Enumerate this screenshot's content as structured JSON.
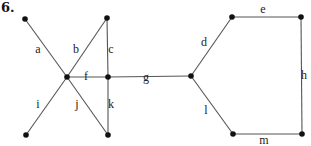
{
  "problem_number": "6.",
  "graph": {
    "nodes": [
      {
        "id": "n1",
        "x": 25,
        "y": 19
      },
      {
        "id": "n2",
        "x": 107,
        "y": 18
      },
      {
        "id": "n3",
        "x": 67,
        "y": 77
      },
      {
        "id": "n4",
        "x": 108,
        "y": 77
      },
      {
        "id": "n5",
        "x": 26,
        "y": 135
      },
      {
        "id": "n6",
        "x": 108,
        "y": 135
      },
      {
        "id": "n7",
        "x": 191,
        "y": 76
      },
      {
        "id": "n8",
        "x": 232,
        "y": 17
      },
      {
        "id": "n9",
        "x": 301,
        "y": 17
      },
      {
        "id": "n10",
        "x": 233,
        "y": 134
      },
      {
        "id": "n11",
        "x": 302,
        "y": 134
      }
    ],
    "edges": [
      {
        "label": "a",
        "from": "n1",
        "to": "n3",
        "lx": 38,
        "ly": 53
      },
      {
        "label": "b",
        "from": "n2",
        "to": "n3",
        "lx": 76,
        "ly": 53
      },
      {
        "label": "c",
        "from": "n2",
        "to": "n4",
        "lx": 111,
        "ly": 53
      },
      {
        "label": "f",
        "from": "n3",
        "to": "n4",
        "lx": 86,
        "ly": 80
      },
      {
        "label": "g",
        "from": "n4",
        "to": "n7",
        "lx": 146,
        "ly": 81
      },
      {
        "label": "i",
        "from": "n5",
        "to": "n3",
        "lx": 38,
        "ly": 108
      },
      {
        "label": "j",
        "from": "n3",
        "to": "n6",
        "lx": 77,
        "ly": 108
      },
      {
        "label": "k",
        "from": "n4",
        "to": "n6",
        "lx": 111,
        "ly": 108
      },
      {
        "label": "d",
        "from": "n7",
        "to": "n8",
        "lx": 204,
        "ly": 46
      },
      {
        "label": "e",
        "from": "n8",
        "to": "n9",
        "lx": 263,
        "ly": 13
      },
      {
        "label": "h",
        "from": "n9",
        "to": "n11",
        "lx": 304,
        "ly": 79
      },
      {
        "label": "l",
        "from": "n7",
        "to": "n10",
        "lx": 206,
        "ly": 114
      },
      {
        "label": "m",
        "from": "n10",
        "to": "n11",
        "lx": 264,
        "ly": 144
      }
    ]
  }
}
